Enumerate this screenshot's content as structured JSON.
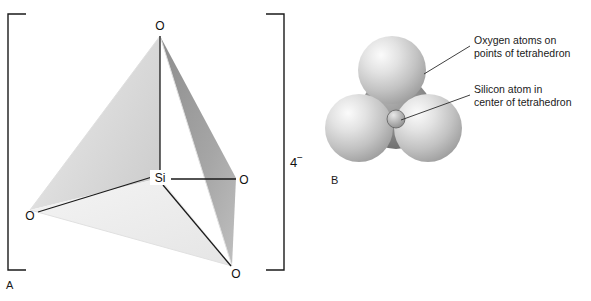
{
  "figure": {
    "background_color": "#ffffff",
    "width": 591,
    "height": 301,
    "ink_color": "#111111"
  },
  "panel_a": {
    "letter": "A",
    "charge": {
      "number": "4",
      "sign": "−"
    },
    "bracket_color": "#1a1a1a",
    "center_atom": {
      "label": "Si",
      "x": 160,
      "y": 178
    },
    "oxygen_atoms": [
      {
        "label": "O",
        "position": "apex-top",
        "x": 160,
        "y": 26
      },
      {
        "label": "O",
        "position": "left-rear",
        "x": 30,
        "y": 216
      },
      {
        "label": "O",
        "position": "right",
        "x": 243,
        "y": 180
      },
      {
        "label": "O",
        "position": "bottom-front",
        "x": 235,
        "y": 273
      }
    ],
    "face_colors": {
      "left_face": "#d8d8d8",
      "right_face": "#9a9a9a",
      "front_face": "#f2f2f2",
      "bottom_face": "#ededed"
    }
  },
  "panel_b": {
    "letter": "B",
    "model_type": "space-filling",
    "spheres": [
      {
        "atom": "oxygen",
        "position": "top",
        "cx": 392,
        "cy": 70,
        "r": 34,
        "color": "#c9c9c9"
      },
      {
        "atom": "oxygen",
        "position": "rear-center",
        "cx": 396,
        "cy": 113,
        "r": 36,
        "color": "#8e8e8e"
      },
      {
        "atom": "oxygen",
        "position": "bottom-left",
        "cx": 359,
        "cy": 128,
        "r": 34,
        "color": "#c4c4c4"
      },
      {
        "atom": "oxygen",
        "position": "bottom-right",
        "cx": 428,
        "cy": 128,
        "r": 34,
        "color": "#c4c4c4"
      },
      {
        "atom": "silicon",
        "position": "center",
        "cx": 396,
        "cy": 119,
        "r": 9,
        "color": "#a8a8a8"
      }
    ],
    "callouts": [
      {
        "id": "oxygen-callout",
        "lines": [
          "Oxygen atoms on",
          "points of tetrahedron"
        ],
        "text_x": 474,
        "text_y": 44,
        "leader": {
          "x1": 424,
          "y1": 74,
          "x2": 470,
          "y2": 46
        }
      },
      {
        "id": "silicon-callout",
        "lines": [
          "Silicon atom in",
          "center of tetrahedron"
        ],
        "text_x": 474,
        "text_y": 93,
        "leader": {
          "x1": 401,
          "y1": 120,
          "x2": 470,
          "y2": 95
        }
      }
    ]
  }
}
